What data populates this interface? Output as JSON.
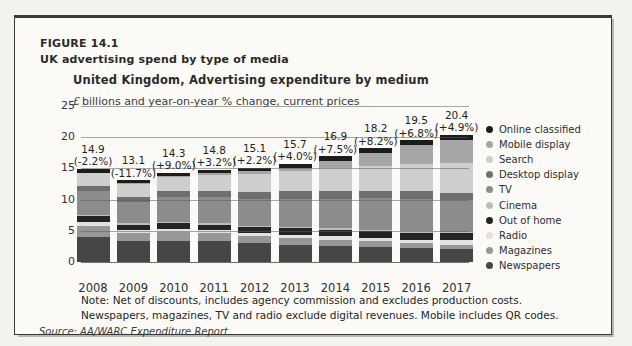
{
  "header": {
    "figure_label": "FIGURE 14.1",
    "figure_caption": "UK advertising spend by type of media",
    "chart_title": "United Kingdom, Advertising expenditure by medium",
    "subtitle_currency": "£",
    "subtitle_text": "billions and year-on-year % change, current prices"
  },
  "footer": {
    "note_line1": "Note: Net of discounts, includes agency commission and excludes production costs.",
    "note_line2": "Newspapers, magazines, TV and radio exclude digital revenues. Mobile includes QR codes.",
    "source": "Source: AA/WARC Expenditure Report"
  },
  "chart_data": {
    "type": "bar",
    "stacked": true,
    "title": "United Kingdom, Advertising expenditure by medium",
    "subtitle": "£ billions and year-on-year % change, current prices",
    "categories": [
      "2008",
      "2009",
      "2010",
      "2011",
      "2012",
      "2013",
      "2014",
      "2015",
      "2016",
      "2017"
    ],
    "totals": [
      14.9,
      13.1,
      14.3,
      14.8,
      15.1,
      15.7,
      16.9,
      18.2,
      19.5,
      20.4
    ],
    "yoy_labels": [
      "(-2.2%)",
      "(-11.7%)",
      "(+9.0%)",
      "(+3.2%)",
      "(+2.2%)",
      "(+4.0%)",
      "(+7.5%)",
      "(+8.2%)",
      "(+6.8%)",
      "(+4.9%)"
    ],
    "ylim": [
      0,
      25
    ],
    "yticks": [
      0,
      5,
      10,
      15,
      20,
      25
    ],
    "grid": true,
    "legend_position": "right",
    "series": [
      {
        "name": "Online classified",
        "color": "#1c1c1c",
        "values": [
          0.65,
          0.5,
          0.6,
          0.6,
          0.6,
          0.6,
          0.7,
          0.7,
          0.8,
          0.9
        ]
      },
      {
        "name": "Mobile display",
        "color": "#a6a6a6",
        "values": [
          0.05,
          0.1,
          0.1,
          0.2,
          0.4,
          0.6,
          1.2,
          2.1,
          3.0,
          3.7
        ]
      },
      {
        "name": "Search",
        "color": "#cecece",
        "values": [
          2.0,
          2.1,
          2.3,
          2.6,
          2.9,
          3.2,
          3.6,
          4.0,
          4.4,
          4.7
        ]
      },
      {
        "name": "Desktop display",
        "color": "#6f6f6f",
        "values": [
          0.8,
          0.8,
          0.9,
          1.0,
          1.1,
          1.2,
          1.3,
          1.2,
          1.2,
          1.2
        ]
      },
      {
        "name": "TV",
        "color": "#8c8c8c",
        "pattern": "hatch",
        "values": [
          3.9,
          3.4,
          4.0,
          4.2,
          4.3,
          4.5,
          4.7,
          5.0,
          5.2,
          5.1
        ]
      },
      {
        "name": "Cinema",
        "color": "#bdbdbd",
        "values": [
          0.2,
          0.2,
          0.2,
          0.2,
          0.2,
          0.2,
          0.2,
          0.2,
          0.2,
          0.2
        ]
      },
      {
        "name": "Out of home",
        "color": "#242424",
        "values": [
          0.9,
          0.8,
          0.9,
          0.9,
          0.9,
          1.0,
          1.0,
          1.1,
          1.1,
          1.1
        ]
      },
      {
        "name": "Radio",
        "color": "#e2e2e2",
        "values": [
          0.6,
          0.5,
          0.5,
          0.5,
          0.5,
          0.5,
          0.6,
          0.6,
          0.6,
          0.7
        ]
      },
      {
        "name": "Magazines",
        "color": "#979797",
        "values": [
          1.8,
          1.4,
          1.4,
          1.3,
          1.2,
          1.1,
          1.0,
          0.9,
          0.8,
          0.7
        ]
      },
      {
        "name": "Newspapers",
        "color": "#464646",
        "values": [
          4.0,
          3.3,
          3.4,
          3.3,
          3.0,
          2.8,
          2.6,
          2.4,
          2.2,
          2.1
        ]
      }
    ]
  }
}
